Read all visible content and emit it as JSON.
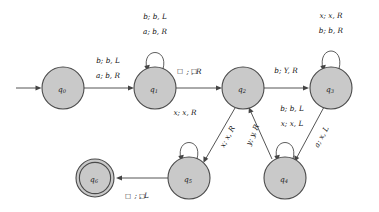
{
  "diagram": {
    "type": "turing-machine-state-diagram",
    "title": "",
    "start_arrow": true,
    "states": [
      {
        "id": "q0",
        "label": "q",
        "sub": "0",
        "x": 63,
        "y": 88,
        "r": 21,
        "accepting": false
      },
      {
        "id": "q1",
        "label": "q",
        "sub": "1",
        "x": 155,
        "y": 88,
        "r": 21,
        "accepting": false
      },
      {
        "id": "q2",
        "label": "q",
        "sub": "2",
        "x": 243,
        "y": 88,
        "r": 21,
        "accepting": false
      },
      {
        "id": "q3",
        "label": "q",
        "sub": "3",
        "x": 331,
        "y": 88,
        "r": 21,
        "accepting": false
      },
      {
        "id": "q4",
        "label": "q",
        "sub": "4",
        "x": 285,
        "y": 178,
        "r": 21,
        "accepting": false
      },
      {
        "id": "q5",
        "label": "q",
        "sub": "5",
        "x": 189,
        "y": 178,
        "r": 21,
        "accepting": false
      },
      {
        "id": "q6",
        "label": "q",
        "sub": "6",
        "x": 95,
        "y": 178,
        "r": 19,
        "accepting": true
      }
    ],
    "transitions": [
      {
        "id": "t-q0-q1",
        "from": "q0",
        "to": "q1",
        "kind": "edge",
        "labels": [
          "b; b, L",
          "a; b, R"
        ]
      },
      {
        "id": "t-q1-q1",
        "from": "q1",
        "to": "q1",
        "kind": "self-loop",
        "labels": [
          "b; b, L",
          "a; b, R"
        ]
      },
      {
        "id": "t-q1-q2",
        "from": "q1",
        "to": "q2",
        "kind": "edge",
        "labels": [
          "□; □, R"
        ]
      },
      {
        "id": "t-q2-q3",
        "from": "q2",
        "to": "q3",
        "kind": "edge",
        "labels": [
          "b; Y, R"
        ]
      },
      {
        "id": "t-q3-q3",
        "from": "q3",
        "to": "q3",
        "kind": "self-loop",
        "labels": [
          "x; x, R",
          "b; b, R"
        ]
      },
      {
        "id": "t-q3-q4",
        "from": "q3",
        "to": "q4",
        "kind": "edge-diagonal",
        "labels": [
          "a; x, L"
        ]
      },
      {
        "id": "t-q4-q4",
        "from": "q4",
        "to": "q4",
        "kind": "self-loop",
        "labels": [
          "b; b, L",
          "x; x, L"
        ]
      },
      {
        "id": "t-q4-q2",
        "from": "q4",
        "to": "q2",
        "kind": "edge-diagonal",
        "labels": [
          "y; y, R"
        ]
      },
      {
        "id": "t-q2-q5",
        "from": "q2",
        "to": "q5",
        "kind": "edge-diagonal",
        "labels": [
          "x; x, R"
        ]
      },
      {
        "id": "t-q5-q5",
        "from": "q5",
        "to": "q5",
        "kind": "self-loop",
        "labels": [
          "x; x, R"
        ]
      },
      {
        "id": "t-q5-q6",
        "from": "q5",
        "to": "q6",
        "kind": "edge",
        "labels": [
          "□; □, L"
        ]
      }
    ],
    "label_text": {
      "q0_q1_top": "b; b, L",
      "q0_q1_bottom": "a; b, R",
      "q1_loop_top": "b; b, L",
      "q1_loop_bottom": "a; b, R",
      "q1_q2": "; , R",
      "q1_q2_blank": "□",
      "q2_q3": "b; Y, R",
      "q3_loop_top": "x; x, R",
      "q3_loop_bottom": "b; b, R",
      "q3_q4": "a; x, L",
      "q4_loop_top": "b; b, L",
      "q4_loop_bottom": "x; x, L",
      "q4_q2": "y; y, R",
      "q2_q5": "x; x, R",
      "q5_loop": "x; x, R",
      "q5_q6": "; , L",
      "q5_q6_blank": "□"
    },
    "colors": {
      "state_fill": "#c9c9c9",
      "state_stroke": "#4a4a4a",
      "edge_stroke": "#555555",
      "text": "#111111",
      "background": "#ffffff"
    }
  }
}
